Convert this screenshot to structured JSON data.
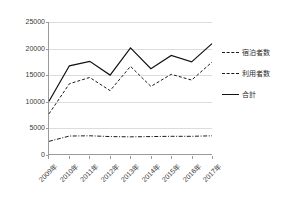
{
  "chart_data": {
    "type": "line",
    "title": "",
    "xlabel": "",
    "ylabel": "",
    "categories": [
      "2009年",
      "2010年",
      "2011年",
      "2012年",
      "2013年",
      "2014年",
      "2015年",
      "2016年",
      "2017年"
    ],
    "ylim": [
      0,
      25000
    ],
    "yticks": [
      0,
      5000,
      10000,
      15000,
      20000,
      25000
    ],
    "ytick_labels": [
      "0",
      "5000",
      "10000",
      "15000",
      "20000",
      "25000"
    ],
    "grid": true,
    "legend_position": "right",
    "series": [
      {
        "name": "宿泊者数",
        "style": "dash-dot",
        "color": "#1a1a1a",
        "values": [
          2400,
          3400,
          3450,
          3300,
          3250,
          3300,
          3350,
          3350,
          3450
        ]
      },
      {
        "name": "利用者数",
        "style": "dashed",
        "color": "#1a1a1a",
        "values": [
          7600,
          13300,
          14500,
          12000,
          16600,
          12800,
          15100,
          14000,
          17400
        ]
      },
      {
        "name": "合計",
        "style": "solid",
        "color": "#111111",
        "values": [
          10000,
          16700,
          17550,
          14950,
          20100,
          16150,
          18650,
          17450,
          20900
        ]
      }
    ]
  },
  "legend": {
    "items": [
      {
        "label": "宿泊者数"
      },
      {
        "label": "利用者数"
      },
      {
        "label": "合計"
      }
    ]
  },
  "axes": {
    "y_max_label": "25000",
    "x_first_label": "2009年",
    "x_last_label": "2017年"
  }
}
